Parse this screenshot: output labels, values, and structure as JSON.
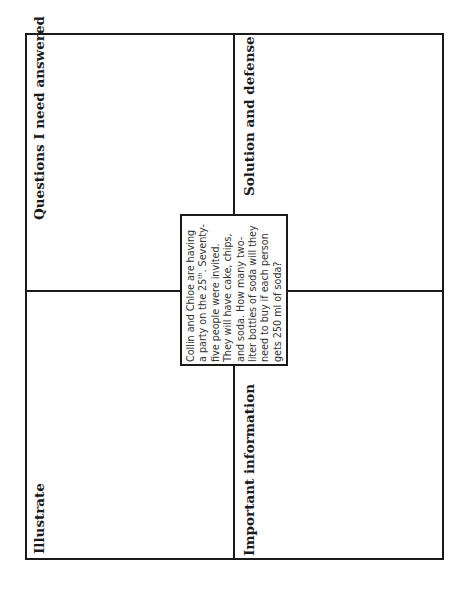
{
  "worksheet": {
    "quadrants": {
      "top_left": {
        "label": "Questions I need  answered"
      },
      "top_right": {
        "label": "Solution and defense"
      },
      "bottom_left": {
        "label": "Illustrate"
      },
      "bottom_right": {
        "label": "Important information"
      }
    },
    "problem": {
      "lines": [
        "Collin and Chloe are having",
        "a party on the 25",
        "five people were invited.",
        "They will have cake, chips,",
        "and soda. How many two-",
        "liter bottles of soda will they",
        "need to buy if each person",
        "gets 250 ml of soda?"
      ],
      "line2_superscript": "th",
      "line2_suffix": ". Seventy-"
    },
    "colors": {
      "line": "#1a1a1a",
      "text": "#333333",
      "background": "#ffffff"
    }
  }
}
